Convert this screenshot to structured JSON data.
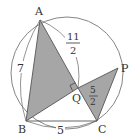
{
  "diagram": {
    "points": {
      "A": {
        "label": "A",
        "x": 40,
        "y": 20
      },
      "B": {
        "label": "B",
        "x": 26,
        "y": 121
      },
      "C": {
        "label": "C",
        "x": 97,
        "y": 121
      },
      "P": {
        "label": "P",
        "x": 118,
        "y": 68
      },
      "Q": {
        "label": "Q",
        "x": 78,
        "y": 88
      }
    },
    "lengths": {
      "AB": "7",
      "BC": "5",
      "AQ_num": "11",
      "AQ_den": "2",
      "QC_num": "5",
      "QC_den": "2"
    },
    "colors": {
      "fill": "#a6a6a6",
      "stroke": "#555555",
      "circle": "#777777"
    }
  }
}
